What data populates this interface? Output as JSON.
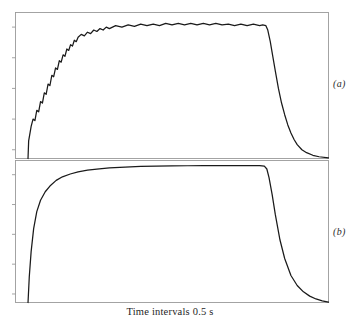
{
  "figure": {
    "background_color": "#ffffff",
    "frame_color": "#9a9a9a",
    "curve_color": "#1a1a1a",
    "xlabel": "Time intervals 0.5 s",
    "panel_a_label": "(a)",
    "panel_b_label": "(b)"
  },
  "chart_data": [
    {
      "type": "line",
      "name": "panel-a",
      "title": "",
      "xlabel": "Time intervals 0.5 s",
      "ylabel": "",
      "xlim": [
        0,
        100
      ],
      "ylim": [
        0,
        100
      ],
      "grid": false,
      "legend": null,
      "annotations": [
        "(a)"
      ],
      "ticks": {
        "y_tick_positions": [
          6,
          27,
          48,
          69,
          90
        ],
        "y_tick_labels": [
          "",
          "",
          "",
          "",
          ""
        ],
        "x_tick_positions": [],
        "x_tick_labels": []
      },
      "description": "Stepped/quantized exponential rise with sawtooth ripple on plateau, then exponential decay",
      "x": [
        4.0,
        4.2,
        5.0,
        5.6,
        6.2,
        6.8,
        7.4,
        8.0,
        8.6,
        9.2,
        9.8,
        10.4,
        11.0,
        11.6,
        12.2,
        12.8,
        13.4,
        14.0,
        14.6,
        15.2,
        15.8,
        16.4,
        17.0,
        17.6,
        18.2,
        18.8,
        19.4,
        20.0,
        21.0,
        22.0,
        23.0,
        24.0,
        25.0,
        26.0,
        27.0,
        28.0,
        29.0,
        30.0,
        32.0,
        34.0,
        36.0,
        38.0,
        40.0,
        42.0,
        44.0,
        46.0,
        48.0,
        50.0,
        52.0,
        54.0,
        56.0,
        58.0,
        60.0,
        62.0,
        64.0,
        66.0,
        68.0,
        70.0,
        72.0,
        74.0,
        76.0,
        78.0,
        79.0,
        80.0,
        80.6,
        81.4,
        82.2,
        83.0,
        84.0,
        85.0,
        86.0,
        87.0,
        88.0,
        89.0,
        90.0,
        91.5,
        93.0,
        95.0,
        97.0,
        100.0
      ],
      "y": [
        0.0,
        12.0,
        22.0,
        27.0,
        26.0,
        33.0,
        32.0,
        39.0,
        38.0,
        45.0,
        44.0,
        51.0,
        50.0,
        57.0,
        56.0,
        62.0,
        61.0,
        67.0,
        66.0,
        71.0,
        70.0,
        75.0,
        74.0,
        78.0,
        77.0,
        81.0,
        80.0,
        83.0,
        85.0,
        84.0,
        86.5,
        85.5,
        88.0,
        87.0,
        89.0,
        88.0,
        90.0,
        89.0,
        91.0,
        90.0,
        91.5,
        90.5,
        92.0,
        91.0,
        92.0,
        91.0,
        92.5,
        91.5,
        92.5,
        91.5,
        92.5,
        91.5,
        92.5,
        91.5,
        92.5,
        91.5,
        92.0,
        91.0,
        92.0,
        91.0,
        92.0,
        91.0,
        91.5,
        91.0,
        88.0,
        80.0,
        70.0,
        60.0,
        48.0,
        38.0,
        30.0,
        23.0,
        17.5,
        13.0,
        9.5,
        6.0,
        4.0,
        2.2,
        1.2,
        0.4
      ]
    },
    {
      "type": "line",
      "name": "panel-b",
      "title": "",
      "xlabel": "Time intervals 0.5 s",
      "ylabel": "",
      "xlim": [
        0,
        100
      ],
      "ylim": [
        0,
        100
      ],
      "grid": false,
      "legend": null,
      "annotations": [
        "(b)"
      ],
      "ticks": {
        "y_tick_positions": [
          6,
          27,
          48,
          69,
          90
        ],
        "y_tick_labels": [
          "",
          "",
          "",
          "",
          ""
        ],
        "x_tick_positions": [],
        "x_tick_labels": []
      },
      "description": "Smooth exponential rise to a flat plateau, then a steep exponential decay",
      "x": [
        4.0,
        4.4,
        5.0,
        5.8,
        6.8,
        8.0,
        9.5,
        11.0,
        13.0,
        15.0,
        17.5,
        20.0,
        23.0,
        26.0,
        30.0,
        35.0,
        40.0,
        45.0,
        50.0,
        55.0,
        60.0,
        65.0,
        70.0,
        75.0,
        78.0,
        79.5,
        80.3,
        81.0,
        82.0,
        83.0,
        84.5,
        86.0,
        88.0,
        90.0,
        92.0,
        94.0,
        96.0,
        98.0,
        100.0
      ],
      "y": [
        0.0,
        18.0,
        36.0,
        52.0,
        64.0,
        72.0,
        78.0,
        82.0,
        86.0,
        88.5,
        90.5,
        92.0,
        93.2,
        94.0,
        94.8,
        95.4,
        95.8,
        96.0,
        96.2,
        96.3,
        96.4,
        96.4,
        96.4,
        96.4,
        96.4,
        96.0,
        94.0,
        88.0,
        76.0,
        62.0,
        44.0,
        31.0,
        19.0,
        12.0,
        7.5,
        4.5,
        2.5,
        1.2,
        0.3
      ]
    }
  ]
}
